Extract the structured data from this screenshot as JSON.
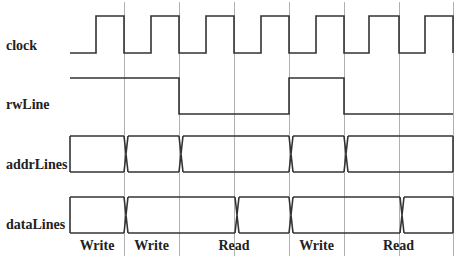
{
  "colors": {
    "background": "#ffffff",
    "signal": "#333333",
    "gridline": "#b0b0b0",
    "text": "#222222"
  },
  "signals": [
    {
      "name": "clock",
      "label": "clock",
      "type": "digital"
    },
    {
      "name": "rwLine",
      "label": "rwLine",
      "type": "digital"
    },
    {
      "name": "addrLines",
      "label": "addrLines",
      "type": "bus"
    },
    {
      "name": "dataLines",
      "label": "dataLines",
      "type": "bus"
    }
  ],
  "phases": [
    {
      "label": "Write",
      "cycles": 1
    },
    {
      "label": "Write",
      "cycles": 1
    },
    {
      "label": "Read",
      "cycles": 2
    },
    {
      "label": "Write",
      "cycles": 1
    },
    {
      "label": "Read",
      "cycles": 2
    }
  ],
  "timing": {
    "cycle_boundaries": [
      124,
      179,
      234,
      289,
      344,
      399,
      453
    ],
    "clock_rising_edges": [
      96,
      151,
      206,
      261,
      316,
      369,
      425
    ],
    "rwLine_levels": [
      "high",
      "high",
      "low",
      "low",
      "high",
      "low",
      "low"
    ],
    "addrLines_transitions": [
      124,
      179,
      289,
      344
    ],
    "dataLines_transitions": [
      124,
      234,
      289,
      399
    ]
  }
}
